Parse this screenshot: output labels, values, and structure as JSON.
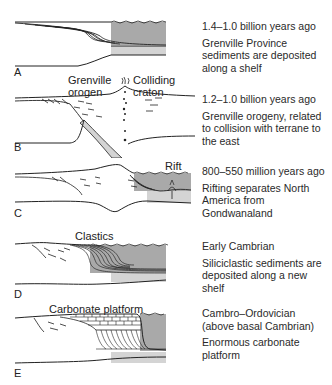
{
  "figure": {
    "panels": [
      {
        "letter": "A",
        "age": "1.4–1.0 billion years ago",
        "description": "Grenville Province sediments are deposited along a shelf",
        "labels": []
      },
      {
        "letter": "B",
        "age": "1.2–1.0 billion years ago",
        "description": "Grenville orogeny, related to collision with terrane to the east",
        "labels": [
          "Grenville orogen",
          "Colliding craton"
        ]
      },
      {
        "letter": "C",
        "age": "800–550 million years ago",
        "description": "Rifting separates North America from Gondwanaland",
        "labels": [
          "Rift"
        ]
      },
      {
        "letter": "D",
        "age": "Early Cambrian",
        "description": "Siliciclastic sediments are deposited along a new shelf",
        "labels": [
          "Clastics"
        ]
      },
      {
        "letter": "E",
        "age": "Cambro–Ordovician (above basal Cambrian)",
        "description": "Enormous carbonate platform",
        "labels": [
          "Carbonate platform"
        ]
      }
    ],
    "colors": {
      "ocean": "#a9a9a9",
      "crust": "#d4d4d4",
      "line": "#222222"
    }
  }
}
